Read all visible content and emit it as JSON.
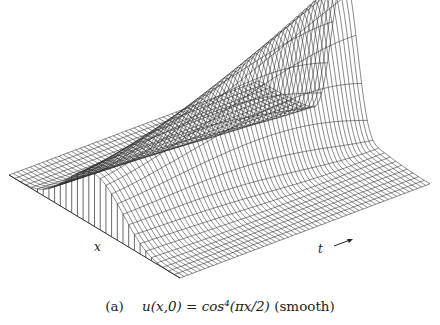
{
  "figure": {
    "panel_tag": "(a)",
    "caption_math": "u(x,0) = cos⁴(πx/2)",
    "caption_note": "(smooth)",
    "x_axis_label": "x",
    "t_axis_label": "t",
    "line_color": "#2a2a2a",
    "background": "#ffffff"
  },
  "chart_data": {
    "type": "surface",
    "title": "(a) u(x,0) = cos⁴(πx/2) (smooth)",
    "xlabel": "x",
    "tlabel": "t",
    "zlabel": "u",
    "initial_condition": "u(x,0) = cos^4(pi x / 2)",
    "x_range": [
      -1,
      1
    ],
    "t_range": [
      0,
      1
    ],
    "grid": {
      "x_lines": 30,
      "t_lines": 60
    },
    "peak_value_relative": 1.0,
    "initial_peak_relative": 0.35
  }
}
